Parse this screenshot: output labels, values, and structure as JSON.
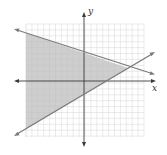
{
  "graph": {
    "axes": {
      "x_label": "x",
      "y_label": "y"
    },
    "colors": {
      "grid": "#dcdcdc",
      "axis": "#3a3a3a",
      "line": "#7a7a7a",
      "shade": "#c8c8c8"
    },
    "grid": {
      "cells_x": 20,
      "cells_y": 19
    },
    "lines": [
      {
        "name": "upper-boundary",
        "description": "decreasing line, y-intercept above origin"
      },
      {
        "name": "lower-boundary",
        "description": "increasing line, y-intercept below origin"
      }
    ],
    "shaded_region": "left of intersection between the two lines"
  }
}
